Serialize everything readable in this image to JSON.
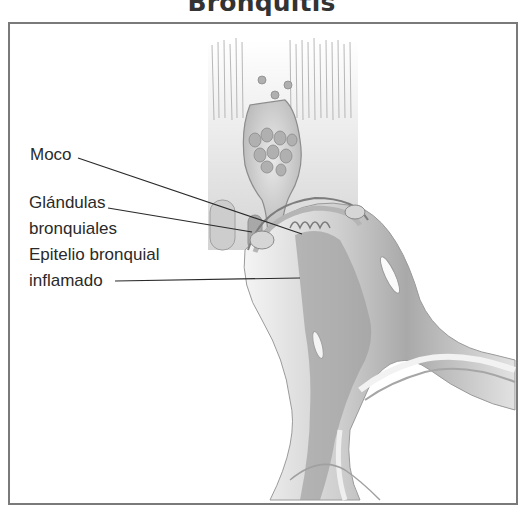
{
  "title": "Bronquitis",
  "labels": {
    "mucus": "Moco",
    "glands_line1": "Glándulas",
    "glands_line2": "bronquiales",
    "epithelium_line1": "Epitelio bronquial",
    "epithelium_line2": "inflamado"
  },
  "colors": {
    "frame": "#7a7a7a",
    "text": "#2a2a2a",
    "tissue_light": "#e6e6e6",
    "tissue_mid": "#c4c4c4",
    "tissue_dark": "#8a8a8a"
  }
}
